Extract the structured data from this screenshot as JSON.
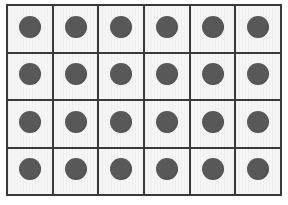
{
  "figure": {
    "kind": "dot-grid",
    "columns": 6,
    "rows": 4,
    "total_dots": 24,
    "colors": {
      "page_background": "#ffffff",
      "cell_background": "#f2f2f2",
      "grid_line": "#3a3a3a",
      "dot_fill": "#585858"
    },
    "geometry": {
      "canvas_width": 288,
      "canvas_height": 205,
      "grid_left": 6,
      "grid_top": 4,
      "grid_width": 276,
      "grid_height": 192,
      "cell_width": 46,
      "cell_height": 48,
      "dot_diameter": 22,
      "border_width": 2
    }
  },
  "chart_data": {
    "type": "heatmap",
    "title": "",
    "subtitle": "",
    "xlabel": "",
    "ylabel": "",
    "grid": true,
    "legend": null,
    "categories": [
      "C1",
      "C2",
      "C3",
      "C4",
      "C5",
      "C6"
    ],
    "row_labels": [
      "R1",
      "R2",
      "R3",
      "R4"
    ],
    "cells": [
      [
        1,
        1,
        1,
        1,
        1,
        1
      ],
      [
        1,
        1,
        1,
        1,
        1,
        1
      ],
      [
        1,
        1,
        1,
        1,
        1,
        1
      ],
      [
        1,
        1,
        1,
        1,
        1,
        1
      ]
    ],
    "value_meaning": "1 = cell contains one filled circle marker",
    "marker_color": "#585858",
    "marker_shape": "circle"
  },
  "rows": [
    {
      "id": "row-1",
      "cells": [
        {
          "id": "r1c1",
          "dot": true
        },
        {
          "id": "r1c2",
          "dot": true
        },
        {
          "id": "r1c3",
          "dot": true
        },
        {
          "id": "r1c4",
          "dot": true
        },
        {
          "id": "r1c5",
          "dot": true
        },
        {
          "id": "r1c6",
          "dot": true
        }
      ]
    },
    {
      "id": "row-2",
      "cells": [
        {
          "id": "r2c1",
          "dot": true
        },
        {
          "id": "r2c2",
          "dot": true
        },
        {
          "id": "r2c3",
          "dot": true
        },
        {
          "id": "r2c4",
          "dot": true
        },
        {
          "id": "r2c5",
          "dot": true
        },
        {
          "id": "r2c6",
          "dot": true
        }
      ]
    },
    {
      "id": "row-3",
      "cells": [
        {
          "id": "r3c1",
          "dot": true
        },
        {
          "id": "r3c2",
          "dot": true
        },
        {
          "id": "r3c3",
          "dot": true
        },
        {
          "id": "r3c4",
          "dot": true
        },
        {
          "id": "r3c5",
          "dot": true
        },
        {
          "id": "r3c6",
          "dot": true
        }
      ]
    },
    {
      "id": "row-4",
      "cells": [
        {
          "id": "r4c1",
          "dot": true
        },
        {
          "id": "r4c2",
          "dot": true
        },
        {
          "id": "r4c3",
          "dot": true
        },
        {
          "id": "r4c4",
          "dot": true
        },
        {
          "id": "r4c5",
          "dot": true
        },
        {
          "id": "r4c6",
          "dot": true
        }
      ]
    }
  ]
}
